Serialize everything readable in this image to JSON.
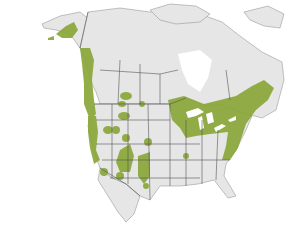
{
  "map": {
    "title": "",
    "region": "North America",
    "colors": {
      "water": "#ffffff",
      "land": "#e6e6e6",
      "border": "#555555",
      "range": "#8aa83a"
    },
    "legend": [],
    "range_areas": [
      "Southern Alaska coast",
      "Pacific Northwest coast",
      "Northern Rocky Mountains",
      "Sierra Nevada / California",
      "Southern Rockies",
      "Great Lakes region",
      "New England and Maritimes",
      "Appalachian Mountains"
    ]
  }
}
